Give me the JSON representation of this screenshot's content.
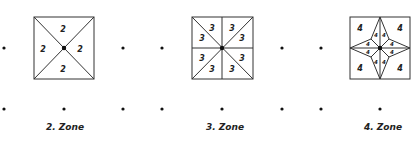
{
  "panels": [
    {
      "label": "2. Zone",
      "zone_number": "2",
      "square": {
        "x": 34,
        "y": 17,
        "size": 61
      },
      "center": [
        64,
        48
      ]
    },
    {
      "label": "3. Zone",
      "zone_number": "3",
      "square": {
        "x": 192,
        "y": 17,
        "size": 61
      },
      "center": [
        222,
        48
      ]
    },
    {
      "label": "4. Zone",
      "zone_number": "4",
      "square": {
        "x": 350,
        "y": 17,
        "size": 61
      },
      "center": [
        380,
        48
      ]
    }
  ],
  "colors": {
    "ink": "#222222",
    "background": "#ffffff"
  }
}
